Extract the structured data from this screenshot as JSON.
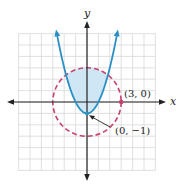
{
  "chart_data": {
    "type": "line",
    "title": "",
    "xlabel": "x",
    "ylabel": "y",
    "xlim": [
      -6,
      6
    ],
    "ylim": [
      -6,
      6
    ],
    "grid": true,
    "series": [
      {
        "name": "parabola",
        "equation": "y = x^2 - 1",
        "style": "solid",
        "color": "#2a8fc4",
        "arrows": true,
        "x_range": [
          -2.65,
          2.65
        ]
      },
      {
        "name": "circle",
        "equation": "x^2 + y^2 = 9",
        "style": "dashed",
        "color": "#c8416b",
        "center": [
          0,
          0
        ],
        "radius": 3
      }
    ],
    "shaded_region": {
      "description": "inside circle and above parabola",
      "color": "#cfe6f5"
    },
    "points": [
      {
        "x": 3,
        "y": 0,
        "label": "(3, 0)"
      },
      {
        "x": 0,
        "y": -1,
        "label": "(0, −1)"
      }
    ],
    "annotations": [
      {
        "text": "(3, 0)",
        "target": [
          3,
          0
        ]
      },
      {
        "text": "(0, −1)",
        "target": [
          0,
          -1
        ],
        "arrow": true
      }
    ]
  },
  "labels": {
    "x_axis": "x",
    "y_axis": "y",
    "point_a": "(3, 0)",
    "point_b": "(0, −1)"
  },
  "colors": {
    "parabola": "#2a8fc4",
    "circle": "#c8416b",
    "shade": "#cfe6f5",
    "axis": "#222222",
    "grid": "#d8d8d8"
  }
}
